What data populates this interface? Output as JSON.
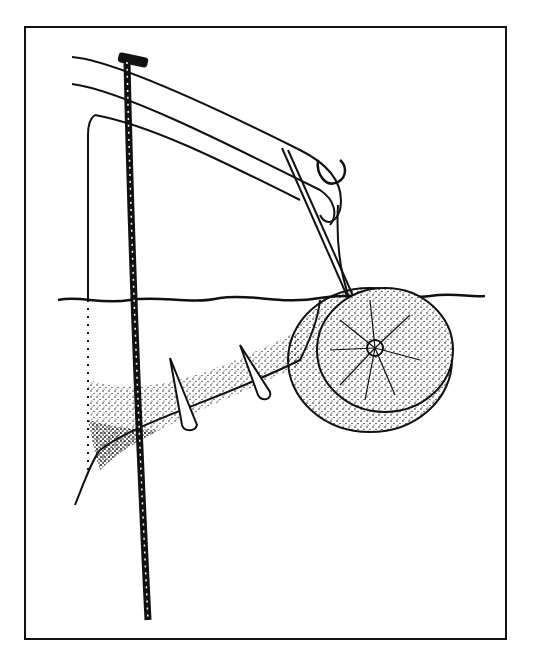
{
  "illustration": {
    "subject": "boat-hull-with-pole-and-fender-wheel",
    "style": "black ink line drawing with stipple shading",
    "colors": {
      "ink": "#111111",
      "paper": "#ffffff"
    }
  }
}
